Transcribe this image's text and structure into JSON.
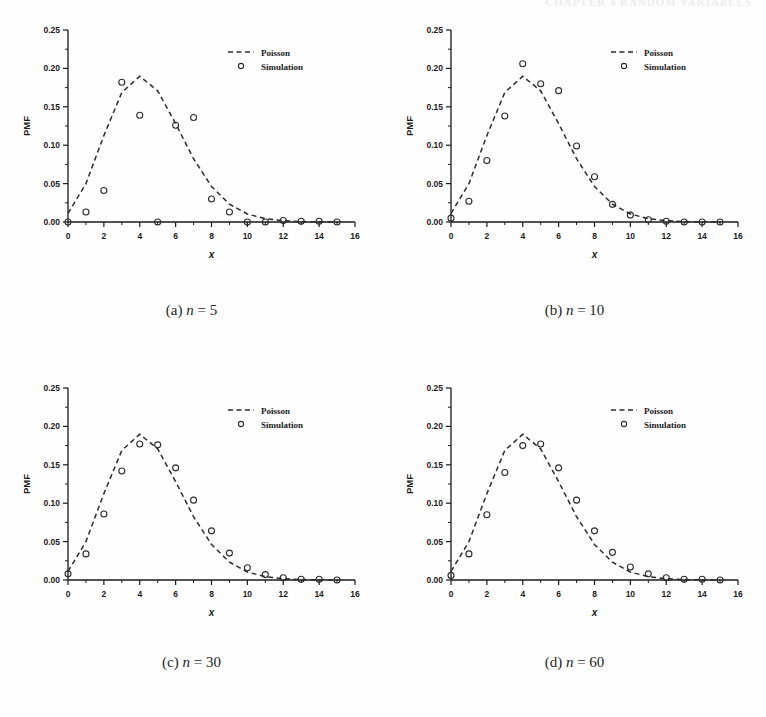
{
  "header": {
    "running_head": "CHAPTER 4  RANDOM VARIABLES"
  },
  "figure": {
    "axis": {
      "xlabel": "x",
      "ylabel": "PMF",
      "xticks": [
        "0",
        "2",
        "4",
        "6",
        "8",
        "10",
        "12",
        "14",
        "16"
      ],
      "xtick_values": [
        0,
        2,
        4,
        6,
        8,
        10,
        12,
        14,
        16
      ],
      "yticks": [
        "0.00",
        "0.05",
        "0.10",
        "0.15",
        "0.20",
        "0.25"
      ],
      "ytick_values": [
        0.0,
        0.05,
        0.1,
        0.15,
        0.2,
        0.25
      ],
      "xlim": [
        0,
        16
      ],
      "ylim": [
        0,
        0.25
      ],
      "x_minor_step": 1,
      "y_minor_step": 0.025
    },
    "legend": {
      "position": "upper-right",
      "entries": [
        {
          "label": "Poisson",
          "marker": "dashed-line"
        },
        {
          "label": "Simulation",
          "marker": "open-circle"
        }
      ]
    },
    "colors": {
      "line": "#2b2b2b",
      "marker": "#2b2b2b",
      "axis": "#1a1a1a",
      "background": "#fefefe"
    },
    "captions": [
      {
        "tag": "(a)",
        "var": "n",
        "eq": "=",
        "value": "5"
      },
      {
        "tag": "(b)",
        "var": "n",
        "eq": "=",
        "value": "10"
      },
      {
        "tag": "(c)",
        "var": "n",
        "eq": "=",
        "value": "30"
      },
      {
        "tag": "(d)",
        "var": "n",
        "eq": "=",
        "value": "60"
      }
    ]
  },
  "chart_data": [
    {
      "type": "scatter",
      "panel": "a",
      "title": "(a) n = 5",
      "xlabel": "x",
      "ylabel": "PMF",
      "xlim": [
        0,
        16
      ],
      "ylim": [
        0,
        0.25
      ],
      "grid": false,
      "legend_position": "upper right",
      "x": [
        0,
        1,
        2,
        3,
        4,
        5,
        6,
        7,
        8,
        9,
        10,
        11,
        12,
        13,
        14,
        15
      ],
      "series": [
        {
          "name": "Poisson",
          "type": "line",
          "style": "dashed",
          "values": [
            0.0111,
            0.05,
            0.1125,
            0.1687,
            0.1898,
            0.1708,
            0.1281,
            0.0824,
            0.0463,
            0.0232,
            0.0104,
            0.0043,
            0.0016,
            0.0006,
            0.0002,
            0.0001
          ]
        },
        {
          "name": "Simulation",
          "type": "markers",
          "style": "open-circle",
          "values": [
            0.0,
            0.013,
            0.041,
            0.182,
            0.139,
            0.0,
            0.126,
            0.136,
            0.03,
            0.013,
            0.0,
            0.0,
            0.002,
            0.001,
            0.001,
            0.0
          ]
        }
      ]
    },
    {
      "type": "scatter",
      "panel": "b",
      "title": "(b) n = 10",
      "xlabel": "x",
      "ylabel": "PMF",
      "xlim": [
        0,
        16
      ],
      "ylim": [
        0,
        0.25
      ],
      "grid": false,
      "legend_position": "upper right",
      "x": [
        0,
        1,
        2,
        3,
        4,
        5,
        6,
        7,
        8,
        9,
        10,
        11,
        12,
        13,
        14,
        15
      ],
      "series": [
        {
          "name": "Poisson",
          "type": "line",
          "style": "dashed",
          "values": [
            0.0111,
            0.05,
            0.1125,
            0.1687,
            0.1898,
            0.1708,
            0.1281,
            0.0824,
            0.0463,
            0.0232,
            0.0104,
            0.0043,
            0.0016,
            0.0006,
            0.0002,
            0.0001
          ]
        },
        {
          "name": "Simulation",
          "type": "markers",
          "style": "open-circle",
          "values": [
            0.005,
            0.027,
            0.08,
            0.138,
            0.206,
            0.18,
            0.171,
            0.099,
            0.059,
            0.023,
            0.009,
            0.003,
            0.001,
            0.0,
            0.0,
            0.0
          ]
        }
      ]
    },
    {
      "type": "scatter",
      "panel": "c",
      "title": "(c) n = 30",
      "xlabel": "x",
      "ylabel": "PMF",
      "xlim": [
        0,
        16
      ],
      "ylim": [
        0,
        0.25
      ],
      "grid": false,
      "legend_position": "upper right",
      "x": [
        0,
        1,
        2,
        3,
        4,
        5,
        6,
        7,
        8,
        9,
        10,
        11,
        12,
        13,
        14,
        15
      ],
      "series": [
        {
          "name": "Poisson",
          "type": "line",
          "style": "dashed",
          "values": [
            0.0111,
            0.05,
            0.1125,
            0.1687,
            0.1898,
            0.1708,
            0.1281,
            0.0824,
            0.0463,
            0.0232,
            0.0104,
            0.0043,
            0.0016,
            0.0006,
            0.0002,
            0.0001
          ]
        },
        {
          "name": "Simulation",
          "type": "markers",
          "style": "open-circle",
          "values": [
            0.008,
            0.034,
            0.086,
            0.142,
            0.177,
            0.176,
            0.146,
            0.104,
            0.064,
            0.035,
            0.016,
            0.007,
            0.003,
            0.001,
            0.001,
            0.0
          ]
        }
      ]
    },
    {
      "type": "scatter",
      "panel": "d",
      "title": "(d) n = 60",
      "xlabel": "x",
      "ylabel": "PMF",
      "xlim": [
        0,
        16
      ],
      "ylim": [
        0,
        0.25
      ],
      "grid": false,
      "legend_position": "upper right",
      "x": [
        0,
        1,
        2,
        3,
        4,
        5,
        6,
        7,
        8,
        9,
        10,
        11,
        12,
        13,
        14,
        15
      ],
      "series": [
        {
          "name": "Poisson",
          "type": "line",
          "style": "dashed",
          "values": [
            0.0111,
            0.05,
            0.1125,
            0.1687,
            0.1898,
            0.1708,
            0.1281,
            0.0824,
            0.0463,
            0.0232,
            0.0104,
            0.0043,
            0.0016,
            0.0006,
            0.0002,
            0.0001
          ]
        },
        {
          "name": "Simulation",
          "type": "markers",
          "style": "open-circle",
          "values": [
            0.006,
            0.034,
            0.085,
            0.14,
            0.175,
            0.177,
            0.146,
            0.104,
            0.064,
            0.036,
            0.017,
            0.008,
            0.003,
            0.001,
            0.001,
            0.0
          ]
        }
      ]
    }
  ]
}
